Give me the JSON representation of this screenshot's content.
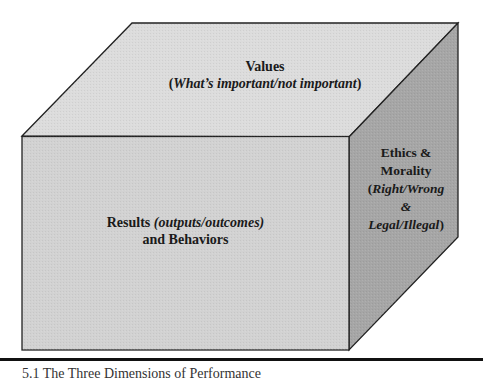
{
  "diagram": {
    "type": "3d-cube",
    "colors": {
      "top_face": "#dcdcdc",
      "front_face": "#d2d2d2",
      "side_face": "#a6a6a6",
      "edge": "#222222",
      "text": "#1a1a1a"
    },
    "top_face": {
      "title": "Values",
      "open_paren": "(",
      "subtitle": "What’s important/not important",
      "close_paren": ")"
    },
    "front_face": {
      "title": "Results",
      "title_italic": "(outputs/outcomes)",
      "line2": "and Behaviors"
    },
    "side_face": {
      "line1": "Ethics &",
      "line2": "Morality",
      "open_paren": "(",
      "line3": "Right/Wrong",
      "line4": "&",
      "line5": "Legal/Illegal",
      "close_paren": ")"
    }
  },
  "caption": {
    "text": "5.1 The Three Dimensions of Performance"
  }
}
